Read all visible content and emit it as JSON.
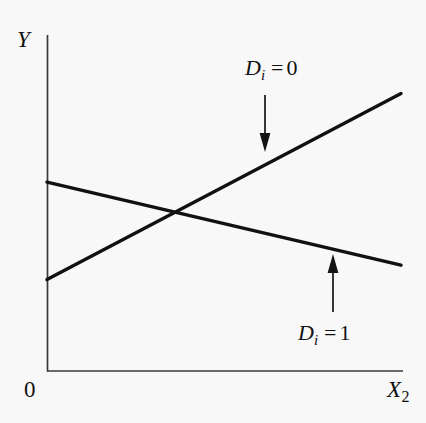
{
  "figure": {
    "background_color": "#f8f8f8",
    "ink_color": "#111111",
    "axis_color": "#3a3a3a"
  },
  "axes": {
    "y_label": "Y",
    "x_label": "X",
    "x_label_subscript": "2",
    "origin_label": "0"
  },
  "annotations": {
    "d0": {
      "variable": "D",
      "subscript": "i",
      "equals": "=",
      "value": "0"
    },
    "d1": {
      "variable": "D",
      "subscript": "i",
      "equals": "=",
      "value": "1"
    }
  },
  "chart_data": {
    "type": "line",
    "title": "",
    "xlabel": "X2",
    "ylabel": "Y",
    "grid": false,
    "legend_position": "inline-annotations",
    "xlim": [
      0,
      1
    ],
    "ylim": [
      0,
      1
    ],
    "axis_origin_label": "0",
    "series": [
      {
        "name": "Di = 0",
        "description": "upward sloping regression line for the base category (dummy = 0)",
        "x": [
          0,
          1
        ],
        "y": [
          0.272,
          0.826
        ],
        "slope_sign": "positive",
        "annotation": "Di = 0",
        "annotation_arrow": "down",
        "line_width_px": 3
      },
      {
        "name": "Di = 1",
        "description": "downward sloping regression line for the dummy category (dummy = 1)",
        "x": [
          0,
          1
        ],
        "y": [
          0.562,
          0.315
        ],
        "slope_sign": "negative",
        "annotation": "Di = 1",
        "annotation_arrow": "up",
        "line_width_px": 3
      }
    ],
    "intersection": {
      "x": 0.35,
      "y": 0.473,
      "note": "the two regression lines cross, indicating differing intercepts and differing slopes"
    },
    "tick_labels": {
      "x": [],
      "y": []
    }
  }
}
